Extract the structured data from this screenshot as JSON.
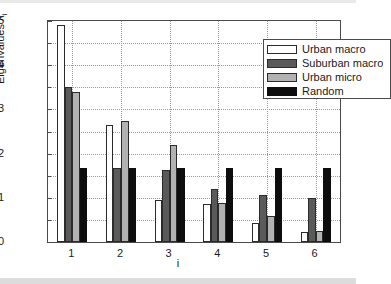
{
  "chart_data": {
    "type": "bar",
    "title": "",
    "xlabel": "i",
    "ylabel": "Eigenvalues λ",
    "ylabel_sub": "i",
    "categories": [
      "1",
      "2",
      "3",
      "4",
      "5",
      "6"
    ],
    "ylim": [
      0,
      0.5
    ],
    "xlim": [
      0.5,
      6.5
    ],
    "ytick_labels": [
      "0",
      "0.1",
      "0.2",
      "0.3",
      "0.4",
      "0.5"
    ],
    "ytick_values": [
      0,
      0.1,
      0.2,
      0.3,
      0.4,
      0.5
    ],
    "yminor_values": [
      0.05,
      0.15,
      0.25,
      0.35,
      0.45
    ],
    "grid": true,
    "grid_style": "dotted",
    "legend_position": "top-right",
    "series": [
      {
        "name": "Urban macro",
        "color": "#ffffff",
        "values": [
          0.49,
          0.265,
          0.095,
          0.086,
          0.043,
          0.023
        ]
      },
      {
        "name": "Suburban macro",
        "color": "#5a5a5a",
        "values": [
          0.35,
          0.167,
          0.164,
          0.12,
          0.107,
          0.099
        ]
      },
      {
        "name": "Urban micro",
        "color": "#b2b2b2",
        "values": [
          0.34,
          0.273,
          0.219,
          0.088,
          0.059,
          0.026
        ]
      },
      {
        "name": "Random",
        "color": "#0d0d0d",
        "values": [
          0.167,
          0.167,
          0.167,
          0.167,
          0.167,
          0.167
        ]
      }
    ]
  }
}
